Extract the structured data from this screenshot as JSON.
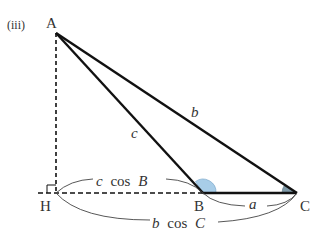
{
  "figure": {
    "panel_label": "(iii)",
    "points": {
      "A": "A",
      "B": "B",
      "C": "C",
      "H": "H"
    },
    "sides": {
      "a": "a",
      "b": "b",
      "c": "c"
    },
    "measures": {
      "c_cos_B": "c cos B",
      "c_cos_B_var": "c",
      "c_cos_B_fn": "cos",
      "c_cos_B_ang": "B",
      "b_cos_C_var": "b",
      "b_cos_C_fn": "cos",
      "b_cos_C_ang": "C"
    },
    "colors": {
      "angle_B": "#a8cde8",
      "angle_C": "#7f9aa8",
      "line": "#111111",
      "label": "#333333"
    }
  }
}
